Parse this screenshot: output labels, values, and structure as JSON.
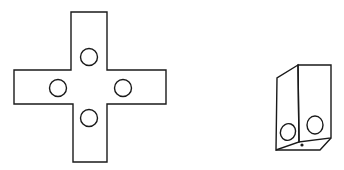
{
  "figure": {
    "colors": {
      "stroke": "#1a1a1a",
      "background": "#ffffff"
    },
    "cross_net": {
      "vertical_arm": {
        "x": 71,
        "y": 12,
        "w": 36,
        "h": 150
      },
      "horizontal_arm": {
        "x": 14,
        "y": 70,
        "w": 152,
        "h": 34
      },
      "holes": [
        {
          "name": "top",
          "cx": 89,
          "cy": 57,
          "r": 8.5
        },
        {
          "name": "left",
          "cx": 58,
          "cy": 88,
          "r": 8.5
        },
        {
          "name": "right",
          "cx": 123,
          "cy": 88,
          "r": 8.5
        },
        {
          "name": "bottom",
          "cx": 89,
          "cy": 118,
          "r": 8.5
        }
      ]
    },
    "folded_box": {
      "holes": [
        {
          "name": "left-face",
          "cx": 288,
          "cy": 132,
          "rx": 7.5,
          "ry": 8.5
        },
        {
          "name": "front-face",
          "cx": 315,
          "cy": 125,
          "rx": 8,
          "ry": 9
        }
      ],
      "dot": {
        "cx": 302,
        "cy": 145,
        "r": 1.6
      }
    }
  }
}
